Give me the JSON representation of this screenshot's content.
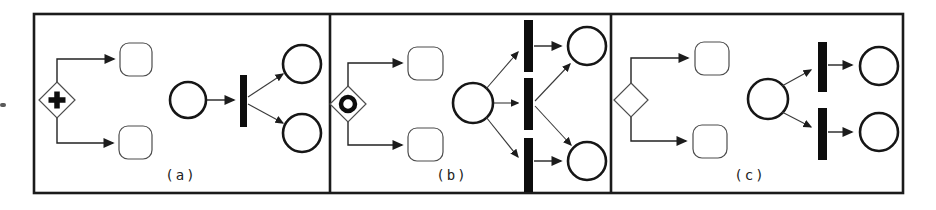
{
  "figure": {
    "background_color": "#ffffff",
    "ink_color": "#1b1b1b",
    "panels": [
      {
        "label": "(a)",
        "gateway_icon": "parallel-and-gateway",
        "gateway_marker": "plus",
        "task_count": 2,
        "petri_net": {
          "input_places": 1,
          "transition_bars": 1,
          "output_places": 2
        }
      },
      {
        "label": "(b)",
        "gateway_icon": "inclusive-or-gateway",
        "gateway_marker": "circle",
        "task_count": 2,
        "petri_net": {
          "input_places": 1,
          "transition_bars": 3,
          "output_places": 2
        }
      },
      {
        "label": "(c)",
        "gateway_icon": "exclusive-xor-gateway",
        "gateway_marker": "none",
        "task_count": 2,
        "petri_net": {
          "input_places": 1,
          "transition_bars": 2,
          "output_places": 2
        }
      }
    ]
  }
}
